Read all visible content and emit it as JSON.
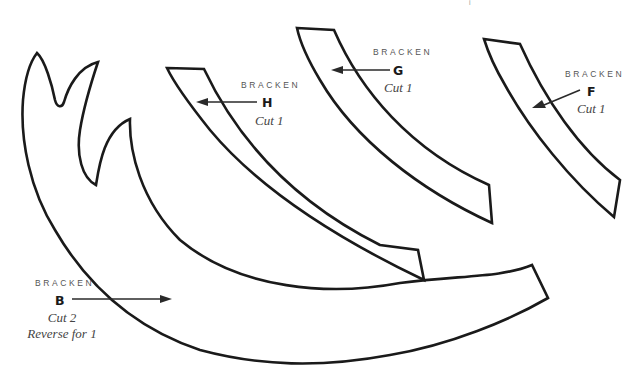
{
  "diagram": {
    "type": "sewing-pattern",
    "corner_mark": "i",
    "pieces": [
      {
        "id": "B",
        "brand": "BRACKEN",
        "letter": "B",
        "cut": "Cut 2",
        "note": "Reverse for 1"
      },
      {
        "id": "H",
        "brand": "BRACKEN",
        "letter": "H",
        "cut": "Cut 1",
        "note": ""
      },
      {
        "id": "G",
        "brand": "BRACKEN",
        "letter": "G",
        "cut": "Cut 1",
        "note": ""
      },
      {
        "id": "F",
        "brand": "BRACKEN",
        "letter": "F",
        "cut": "Cut 1",
        "note": ""
      }
    ],
    "colors": {
      "outline": "#1a1a1a",
      "label": "#555555",
      "background": "#ffffff"
    }
  }
}
